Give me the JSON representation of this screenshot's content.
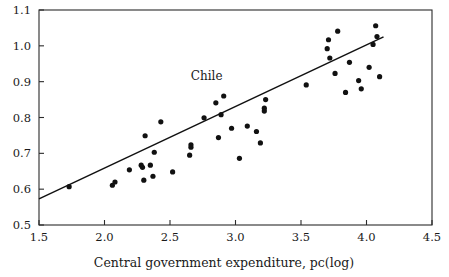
{
  "chart_data": {
    "type": "scatter",
    "title": "",
    "xlabel": "Central government expenditure, pc(log)",
    "ylabel": "",
    "xlim": [
      1.5,
      4.5
    ],
    "ylim": [
      0.5,
      1.1
    ],
    "xticks": [
      "1.5",
      "2.0",
      "2.5",
      "3.0",
      "3.5",
      "4.0",
      "4.5"
    ],
    "xtick_values": [
      1.5,
      2.0,
      2.5,
      3.0,
      3.5,
      4.0,
      4.5
    ],
    "yticks": [
      "0.5",
      "0.6",
      "0.7",
      "0.8",
      "0.9",
      "1.0",
      "1.1"
    ],
    "ytick_values": [
      0.5,
      0.6,
      0.7,
      0.8,
      0.9,
      1.0,
      1.1
    ],
    "grid": false,
    "legend": null,
    "marker": "filled-circle",
    "marker_color": "#111111",
    "points": [
      [
        1.73,
        0.607
      ],
      [
        2.06,
        0.611
      ],
      [
        2.08,
        0.62
      ],
      [
        2.19,
        0.654
      ],
      [
        2.28,
        0.667
      ],
      [
        2.29,
        0.661
      ],
      [
        2.3,
        0.625
      ],
      [
        2.31,
        0.749
      ],
      [
        2.35,
        0.667
      ],
      [
        2.37,
        0.636
      ],
      [
        2.38,
        0.703
      ],
      [
        2.43,
        0.788
      ],
      [
        2.52,
        0.648
      ],
      [
        2.65,
        0.695
      ],
      [
        2.66,
        0.717
      ],
      [
        2.66,
        0.724
      ],
      [
        2.76,
        0.799
      ],
      [
        2.85,
        0.841
      ],
      [
        2.87,
        0.744
      ],
      [
        2.89,
        0.808
      ],
      [
        2.91,
        0.86
      ],
      [
        2.97,
        0.77
      ],
      [
        3.03,
        0.686
      ],
      [
        3.09,
        0.776
      ],
      [
        3.16,
        0.761
      ],
      [
        3.19,
        0.729
      ],
      [
        3.22,
        0.818
      ],
      [
        3.22,
        0.826
      ],
      [
        3.23,
        0.85
      ],
      [
        3.54,
        0.891
      ],
      [
        3.7,
        0.992
      ],
      [
        3.71,
        1.017
      ],
      [
        3.72,
        0.966
      ],
      [
        3.76,
        0.923
      ],
      [
        3.78,
        1.041
      ],
      [
        3.84,
        0.87
      ],
      [
        3.87,
        0.954
      ],
      [
        3.94,
        0.903
      ],
      [
        3.96,
        0.88
      ],
      [
        4.02,
        0.94
      ],
      [
        4.05,
        1.004
      ],
      [
        4.07,
        1.056
      ],
      [
        4.08,
        1.026
      ],
      [
        4.1,
        0.914
      ]
    ],
    "fit_line": {
      "label": "regression-line",
      "x_start": 1.5,
      "y_start": 0.573,
      "x_end": 4.13,
      "y_end": 1.025
    },
    "annotations": [
      {
        "text": "Chile",
        "x": 2.78,
        "y": 0.905
      }
    ]
  }
}
